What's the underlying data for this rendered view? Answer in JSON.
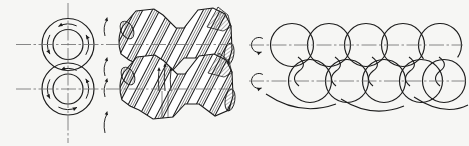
{
  "meta": {
    "figure_type": "engineering-diagram",
    "background_color": "#f6f6f4",
    "line_color": "#1c1c1c",
    "centerline_color": "#6b6b6b"
  },
  "figure": {
    "end_view": {
      "cx": 68,
      "vertical_centerline": {
        "y1": 3,
        "y2": 143
      },
      "rotors": [
        {
          "cy": 44.5,
          "outer_r": 26,
          "inner_r": 15,
          "rotation": "counterclockwise"
        },
        {
          "cy": 89,
          "outer_r": 26,
          "inner_r": 15,
          "rotation": "counterclockwise"
        }
      ],
      "rotation_arrow_radius": 20.5
    },
    "axial_flow_arrows": {
      "x": 106,
      "segments_y": [
        [
          36,
          17
        ],
        [
          76,
          57
        ],
        [
          97,
          78
        ],
        [
          133,
          111
        ]
      ]
    },
    "side_view": {
      "left": 121,
      "right": 232,
      "screw_offsets_y": [
        0,
        46
      ],
      "flight_band_pitch": 17,
      "nip_arrows_x": [
        159,
        165,
        171
      ],
      "nip_lines_x": [
        162,
        168
      ]
    },
    "cross_section_view": {
      "radius": 21.5,
      "top_row": {
        "cy": 45,
        "centers_x": [
          292,
          329,
          366,
          403
        ],
        "partial_arc_cx": 440
      },
      "bottom_row": {
        "cy": 81,
        "centers_x": [
          310,
          347,
          384,
          421,
          444
        ]
      },
      "waist_mid_x": [
        300,
        337,
        374,
        411,
        441
      ],
      "rotation_arrows": [
        {
          "cx": 259,
          "cy": 45
        },
        {
          "cx": 259,
          "cy": 81
        }
      ],
      "under_arcs": [
        [
          266,
          94,
          300,
          117,
          336,
          104
        ],
        [
          341,
          99,
          372,
          119,
          404,
          106
        ],
        [
          414,
          97,
          444,
          117,
          468,
          105
        ]
      ]
    },
    "centerlines": {
      "left_view": [
        {
          "y": 44.5,
          "x1": 16,
          "x2": 236
        },
        {
          "y": 89,
          "x1": 16,
          "x2": 236
        }
      ],
      "right_view": [
        {
          "y": 45,
          "x1": 249,
          "x2": 463
        },
        {
          "y": 81,
          "x1": 249,
          "x2": 466
        }
      ]
    }
  }
}
